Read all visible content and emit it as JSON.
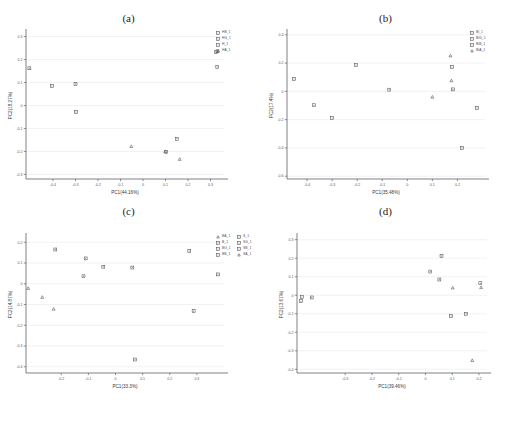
{
  "figure": {
    "clipped_header_text": "·· ·· ·· · · · · · · · · · ·",
    "background": "#ffffff",
    "marker_color": "#4a4a52",
    "grid_color": "#e9e9ee",
    "axis_color": "#4a4a52"
  },
  "panels": [
    {
      "id": "a",
      "caption": "(a)",
      "chart_data": {
        "type": "scatter",
        "title": "(a)",
        "xlabel": "PC1(44.16%)",
        "ylabel": "PC2(18.27%)",
        "xlim": [
          -0.52,
          0.36
        ],
        "ylim": [
          -0.32,
          0.32
        ],
        "xticks": [
          -0.4,
          -0.3,
          -0.2,
          -0.1,
          0,
          0.1,
          0.2,
          0.3
        ],
        "xtick_labels": [
          "-0.4",
          "-0.3",
          "-0.2",
          "-0.1",
          "0",
          "0.1",
          "0.2",
          "0.3"
        ],
        "yticks": [
          -0.3,
          -0.2,
          -0.1,
          0,
          0.1,
          0.2,
          0.3
        ],
        "ytick_labels": [
          "-0.3",
          "-0.2",
          "-0.1",
          "0",
          "0.1",
          "0.2",
          "0.3"
        ],
        "grid": true,
        "legend_position": "right",
        "legend": [
          "HB_1",
          "HG_1",
          "H_1",
          "HA_1"
        ],
        "series": [
          {
            "name": "HB_1",
            "marker": "square",
            "points": [
              [
                0.325,
                0.232
              ],
              [
                0.331,
                0.236
              ],
              [
                0.33,
                0.168
              ]
            ]
          },
          {
            "name": "HG_1",
            "marker": "square",
            "points": [
              [
                -0.505,
                0.162
              ],
              [
                -0.405,
                0.085
              ],
              [
                -0.3,
                0.094
              ]
            ]
          },
          {
            "name": "H_1",
            "marker": "square",
            "points": [
              [
                -0.298,
                -0.028
              ],
              [
                0.103,
                -0.202
              ],
              [
                0.15,
                -0.145
              ]
            ]
          },
          {
            "name": "HA_1",
            "marker": "triangle",
            "points": [
              [
                -0.052,
                -0.178
              ],
              [
                0.099,
                -0.2
              ],
              [
                0.163,
                -0.234
              ]
            ]
          }
        ]
      }
    },
    {
      "id": "b",
      "caption": "(b)",
      "chart_data": {
        "type": "scatter",
        "title": "(b)",
        "xlabel": "PC1(35.48%)",
        "ylabel": "PC2(17.4%)",
        "xlim": [
          -0.48,
          0.31
        ],
        "ylim": [
          -0.62,
          0.42
        ],
        "xticks": [
          -0.4,
          -0.3,
          -0.2,
          -0.1,
          0,
          0.1,
          0.2
        ],
        "xtick_labels": [
          "-0.4",
          "-0.3",
          "-0.2",
          "-0.1",
          "0",
          "0.1",
          "0.2"
        ],
        "yticks": [
          -0.6,
          -0.4,
          -0.2,
          0,
          0.2,
          0.4
        ],
        "ytick_labels": [
          "-0.6",
          "-0.4",
          "-0.2",
          "0",
          "0.2",
          "0.4"
        ],
        "grid": true,
        "legend_position": "right",
        "legend": [
          "BI_1",
          "BIG_1",
          "BIB_1",
          "BIA_1"
        ],
        "series": [
          {
            "name": "BI_1",
            "marker": "square",
            "points": [
              [
                -0.452,
                0.088
              ],
              [
                -0.372,
                -0.098
              ],
              [
                -0.3,
                -0.188
              ]
            ]
          },
          {
            "name": "BIG_1",
            "marker": "square",
            "points": [
              [
                -0.205,
                0.186
              ],
              [
                -0.072,
                0.012
              ],
              [
                0.278,
                -0.118
              ]
            ]
          },
          {
            "name": "BIB_1",
            "marker": "square",
            "points": [
              [
                0.178,
                0.172
              ],
              [
                0.182,
                0.014
              ],
              [
                0.218,
                -0.4
              ]
            ]
          },
          {
            "name": "BIA_1",
            "marker": "triangle",
            "points": [
              [
                0.1,
                -0.04
              ],
              [
                0.172,
                0.252
              ],
              [
                0.176,
                0.076
              ]
            ]
          }
        ]
      }
    },
    {
      "id": "c",
      "caption": "(c)",
      "chart_data": {
        "type": "scatter",
        "title": "(c)",
        "xlabel": "PC1(33.3%)",
        "ylabel": "PC2(14.87%)",
        "xlim": [
          -0.33,
          0.4
        ],
        "ylim": [
          -0.43,
          0.23
        ],
        "xticks": [
          -0.2,
          -0.1,
          0,
          0.1,
          0.2,
          0.3
        ],
        "xtick_labels": [
          "-0.2",
          "-0.1",
          "0",
          "0.1",
          "0.2",
          "0.3"
        ],
        "yticks": [
          -0.4,
          -0.3,
          -0.2,
          -0.1,
          0,
          0.1,
          0.2
        ],
        "ytick_labels": [
          "-0.4",
          "-0.3",
          "-0.2",
          "-0.1",
          "0",
          "0.1",
          "0.2"
        ],
        "grid": true,
        "legend_position": "right",
        "legend": [
          "BA_1",
          "B_1",
          "BG_1",
          "BB_1"
        ],
        "series": [
          {
            "name": "BA_1",
            "marker": "triangle",
            "points": [
              [
                -0.322,
                -0.022
              ],
              [
                -0.27,
                -0.065
              ],
              [
                -0.228,
                -0.122
              ]
            ]
          },
          {
            "name": "B_1",
            "marker": "square",
            "points": [
              [
                -0.222,
                0.165
              ],
              [
                -0.11,
                0.122
              ],
              [
                -0.118,
                0.036
              ]
            ]
          },
          {
            "name": "BG_1",
            "marker": "square",
            "points": [
              [
                -0.045,
                0.082
              ],
              [
                0.062,
                0.078
              ],
              [
                0.072,
                -0.365
              ]
            ]
          },
          {
            "name": "BB_1",
            "marker": "square",
            "points": [
              [
                0.272,
                0.158
              ],
              [
                0.288,
                -0.132
              ],
              [
                0.378,
                0.045
              ]
            ]
          }
        ]
      }
    },
    {
      "id": "d",
      "caption": "(d)",
      "chart_data": {
        "type": "scatter",
        "title": "(d)",
        "xlabel": "PC1(39.46%)",
        "ylabel": "PC2(13.67%)",
        "xlim": [
          -0.48,
          0.23
        ],
        "ylim": [
          -0.42,
          0.32
        ],
        "xticks": [
          -0.3,
          -0.2,
          -0.1,
          0,
          0.1,
          0.2
        ],
        "xtick_labels": [
          "-0.3",
          "-0.2",
          "-0.1",
          "0",
          "0.1",
          "0.2"
        ],
        "yticks": [
          -0.4,
          -0.3,
          -0.2,
          -0.1,
          0,
          0.1,
          0.2,
          0.3
        ],
        "ytick_labels": [
          "-0.4",
          "-0.3",
          "-0.2",
          "-0.1",
          "0",
          "0.1",
          "0.2",
          "0.3"
        ],
        "grid": true,
        "legend_position": "left",
        "legend": [
          "S_1",
          "SG_1",
          "SB_1",
          "SA_1"
        ],
        "series": [
          {
            "name": "S_1",
            "marker": "square",
            "points": [
              [
                -0.462,
                -0.01
              ],
              [
                -0.465,
                -0.032
              ],
              [
                -0.425,
                -0.012
              ]
            ]
          },
          {
            "name": "SG_1",
            "marker": "square",
            "points": [
              [
                0.018,
                0.128
              ],
              [
                0.06,
                0.212
              ],
              [
                0.052,
                0.085
              ]
            ]
          },
          {
            "name": "SB_1",
            "marker": "square",
            "points": [
              [
                0.096,
                -0.112
              ],
              [
                0.152,
                -0.1
              ],
              [
                0.205,
                0.065
              ]
            ]
          },
          {
            "name": "SA_1",
            "marker": "triangle",
            "points": [
              [
                0.102,
                0.04
              ],
              [
                0.208,
                0.042
              ],
              [
                0.175,
                -0.352
              ]
            ]
          }
        ]
      }
    }
  ]
}
